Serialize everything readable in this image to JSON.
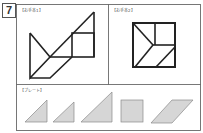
{
  "problem_number": "7",
  "panels": {
    "example1": {
      "label": "【お手本1】"
    },
    "example2": {
      "label": "【お手本2】"
    },
    "plate": {
      "label": "【プレート】"
    }
  },
  "colors": {
    "outline": "#222222",
    "frame": "#555555",
    "piece_fill": "#d6d6d6",
    "piece_stroke": "#8a8a8a"
  },
  "plate_pieces": [
    "small-triangle",
    "small-triangle",
    "large-triangle",
    "square",
    "parallelogram"
  ]
}
